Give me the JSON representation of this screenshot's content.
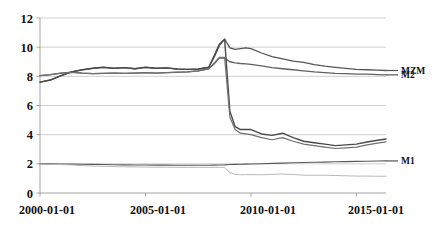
{
  "chart_data": {
    "type": "line",
    "title": "",
    "xlabel": "",
    "ylabel": "",
    "grid": true,
    "legend_position": "right-inline",
    "xlim": [
      "2000-01-01",
      "2016-06-01"
    ],
    "ylim": [
      0,
      12
    ],
    "yticks": [
      0,
      2,
      4,
      6,
      8,
      10,
      12
    ],
    "ytick_labels": [
      "0",
      "2",
      "4",
      "6",
      "8",
      "10",
      "12"
    ],
    "xticks": [
      "2000-01-01",
      "2005-01-01",
      "2010-01-01",
      "2015-01-01"
    ],
    "xtick_labels": [
      "2000-01-01",
      "2005-01-01",
      "2010-01-01",
      "2015-01-01"
    ],
    "x": [
      2000.0,
      2000.5,
      2001.0,
      2001.5,
      2002.0,
      2002.5,
      2003.0,
      2003.5,
      2004.0,
      2004.5,
      2005.0,
      2005.5,
      2006.0,
      2006.5,
      2007.0,
      2007.5,
      2008.0,
      2008.25,
      2008.5,
      2008.75,
      2009.0,
      2009.25,
      2009.5,
      2009.75,
      2010.0,
      2010.5,
      2011.0,
      2011.5,
      2012.0,
      2012.5,
      2013.0,
      2013.5,
      2014.0,
      2014.5,
      2015.0,
      2015.5,
      2016.0,
      2016.4
    ],
    "series": [
      {
        "name": "MZM",
        "color": "#555555",
        "width": 1.3,
        "values": [
          7.6,
          7.75,
          8.05,
          8.3,
          8.45,
          8.55,
          8.62,
          8.55,
          8.6,
          8.52,
          8.62,
          8.55,
          8.58,
          8.5,
          8.48,
          8.5,
          8.62,
          9.3,
          10.1,
          10.55,
          9.95,
          9.85,
          9.9,
          9.95,
          9.9,
          9.6,
          9.35,
          9.2,
          9.05,
          8.95,
          8.8,
          8.7,
          8.62,
          8.55,
          8.48,
          8.45,
          8.42,
          8.4
        ]
      },
      {
        "name": "M2",
        "color": "#606060",
        "width": 1.3,
        "values": [
          8.05,
          8.12,
          8.22,
          8.28,
          8.22,
          8.18,
          8.2,
          8.22,
          8.2,
          8.22,
          8.25,
          8.22,
          8.25,
          8.28,
          8.3,
          8.38,
          8.52,
          8.85,
          9.25,
          9.25,
          9.0,
          8.92,
          8.88,
          8.85,
          8.82,
          8.72,
          8.6,
          8.52,
          8.45,
          8.38,
          8.3,
          8.25,
          8.2,
          8.18,
          8.15,
          8.15,
          8.12,
          8.1
        ]
      },
      {
        "name": "MZM-crash",
        "color": "#4a4a4a",
        "width": 1.4,
        "values": [
          7.6,
          7.75,
          8.05,
          8.3,
          8.45,
          8.55,
          8.62,
          8.55,
          8.6,
          8.52,
          8.62,
          8.55,
          8.58,
          8.5,
          8.48,
          8.5,
          8.62,
          9.4,
          10.2,
          10.55,
          5.6,
          4.55,
          4.35,
          4.35,
          4.35,
          4.05,
          3.95,
          4.1,
          3.8,
          3.55,
          3.45,
          3.35,
          3.25,
          3.3,
          3.35,
          3.5,
          3.62,
          3.7
        ]
      },
      {
        "name": "M2-crash",
        "color": "#707070",
        "width": 1.2,
        "values": [
          8.05,
          8.12,
          8.22,
          8.28,
          8.22,
          8.18,
          8.2,
          8.22,
          8.2,
          8.22,
          8.25,
          8.22,
          8.25,
          8.28,
          8.3,
          8.38,
          8.52,
          8.9,
          9.3,
          9.3,
          5.2,
          4.35,
          4.1,
          4.05,
          4.0,
          3.8,
          3.65,
          3.8,
          3.55,
          3.35,
          3.25,
          3.15,
          3.05,
          3.1,
          3.15,
          3.3,
          3.42,
          3.5
        ]
      },
      {
        "name": "M1",
        "color": "#595959",
        "width": 1.1,
        "values": [
          2.0,
          2.0,
          1.99,
          1.98,
          1.97,
          1.96,
          1.95,
          1.94,
          1.93,
          1.92,
          1.92,
          1.91,
          1.91,
          1.9,
          1.9,
          1.9,
          1.9,
          1.91,
          1.92,
          1.93,
          1.95,
          1.96,
          1.97,
          1.98,
          1.99,
          2.01,
          2.03,
          2.05,
          2.07,
          2.09,
          2.11,
          2.12,
          2.14,
          2.15,
          2.17,
          2.18,
          2.19,
          2.2
        ]
      },
      {
        "name": "M1-lower",
        "color": "#b9b9b9",
        "width": 1.0,
        "values": [
          1.98,
          1.97,
          1.95,
          1.92,
          1.88,
          1.85,
          1.83,
          1.81,
          1.8,
          1.79,
          1.78,
          1.77,
          1.77,
          1.76,
          1.76,
          1.76,
          1.76,
          1.76,
          1.76,
          1.76,
          1.4,
          1.28,
          1.25,
          1.26,
          1.26,
          1.25,
          1.28,
          1.3,
          1.27,
          1.22,
          1.22,
          1.22,
          1.2,
          1.18,
          1.16,
          1.16,
          1.15,
          1.15
        ]
      }
    ],
    "legend_entries": [
      {
        "label": "MZM",
        "value_at_end": 8.4
      },
      {
        "label": "M2",
        "value_at_end": 8.1
      },
      {
        "label": "M1",
        "value_at_end": 2.2
      }
    ]
  },
  "axis_colors": {
    "gridline": "#c9c9c9",
    "axis": "#9a9a9a",
    "text": "#111111"
  }
}
